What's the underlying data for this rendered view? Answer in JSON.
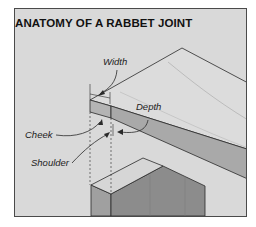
{
  "title": "ANATOMY OF A RABBET JOINT",
  "labels": {
    "width": "Width",
    "depth": "Depth",
    "cheek": "Cheek",
    "shoulder": "Shoulder"
  },
  "colors": {
    "panel_bg": "#d9d9d9",
    "board_top": "#dcdcdc",
    "board_edge": "#a9a9a9",
    "post_side": "#8f8f8f",
    "post_front": "#a3a3a3",
    "line": "#2a2a2a"
  }
}
